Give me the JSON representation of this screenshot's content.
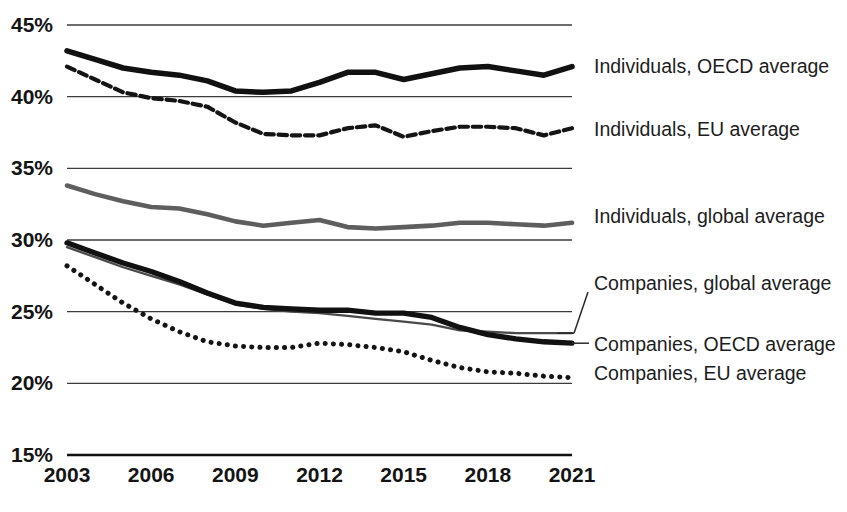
{
  "chart_data": {
    "type": "line",
    "title": "",
    "subtitle": "",
    "xlabel": "",
    "ylabel": "",
    "x": [
      2003,
      2004,
      2005,
      2006,
      2007,
      2008,
      2009,
      2010,
      2011,
      2012,
      2013,
      2014,
      2015,
      2016,
      2017,
      2018,
      2019,
      2020,
      2021
    ],
    "xlim": [
      2003,
      2021
    ],
    "ylim": [
      15,
      45
    ],
    "ytick_labels": [
      "45%",
      "40%",
      "35%",
      "30%",
      "25%",
      "20%",
      "15%"
    ],
    "ytick_values": [
      45,
      40,
      35,
      30,
      25,
      20,
      15
    ],
    "xtick_labels": [
      "2003",
      "2006",
      "2009",
      "2012",
      "2015",
      "2018",
      "2021"
    ],
    "xtick_values": [
      2003,
      2006,
      2009,
      2012,
      2015,
      2018,
      2021
    ],
    "grid": true,
    "grid_axis": "y",
    "legend_position": "right-inline-labels",
    "series": [
      {
        "name": "Individuals, OECD average",
        "style": "solid-bold",
        "color": "#111111",
        "width": 5.5,
        "label_y_pct": 42.5,
        "values": [
          43.2,
          42.6,
          42.0,
          41.7,
          41.5,
          41.1,
          40.4,
          40.3,
          40.4,
          41.0,
          41.7,
          41.7,
          41.2,
          41.6,
          42.0,
          42.1,
          41.8,
          41.5,
          42.1
        ]
      },
      {
        "name": "Individuals, EU average",
        "style": "dashed",
        "color": "#141414",
        "width": 4.2,
        "label_y_pct": 38.3,
        "values": [
          42.1,
          41.2,
          40.3,
          39.9,
          39.7,
          39.3,
          38.2,
          37.4,
          37.3,
          37.3,
          37.8,
          38.0,
          37.2,
          37.6,
          37.9,
          37.9,
          37.8,
          37.3,
          37.8
        ]
      },
      {
        "name": "Individuals, global average",
        "style": "solid-gray",
        "color": "#5e5e5e",
        "width": 4.6,
        "label_y_pct": 31.9,
        "values": [
          33.8,
          33.2,
          32.7,
          32.3,
          32.2,
          31.8,
          31.3,
          31.0,
          31.2,
          31.4,
          30.9,
          30.8,
          30.9,
          31.0,
          31.2,
          31.2,
          31.1,
          31.0,
          31.2
        ]
      },
      {
        "name": "Companies, global average",
        "style": "solid-thin",
        "color": "#4a4a4a",
        "width": 2.3,
        "label_y_pct": 27.3,
        "values": [
          29.5,
          28.8,
          28.1,
          27.5,
          26.9,
          26.2,
          25.5,
          25.2,
          25.0,
          24.9,
          24.7,
          24.5,
          24.3,
          24.1,
          23.7,
          23.6,
          23.5,
          23.5,
          23.5
        ]
      },
      {
        "name": "Companies, OECD average",
        "style": "solid-bold",
        "color": "#111111",
        "width": 5.3,
        "label_y_pct": 23.1,
        "values": [
          29.8,
          29.1,
          28.4,
          27.8,
          27.1,
          26.3,
          25.6,
          25.3,
          25.2,
          25.1,
          25.1,
          24.9,
          24.9,
          24.6,
          23.9,
          23.4,
          23.1,
          22.9,
          22.8
        ]
      },
      {
        "name": "Companies, EU average",
        "style": "dotted",
        "color": "#141414",
        "width": 5.0,
        "label_y_pct": 20.8,
        "values": [
          28.2,
          26.9,
          25.6,
          24.5,
          23.6,
          22.9,
          22.6,
          22.5,
          22.5,
          22.8,
          22.7,
          22.5,
          22.2,
          21.6,
          21.1,
          20.8,
          20.7,
          20.5,
          20.4
        ]
      }
    ]
  },
  "axes": {
    "y_labels": [
      "45%",
      "40%",
      "35%",
      "30%",
      "25%",
      "20%",
      "15%"
    ],
    "x_labels": [
      "2003",
      "2006",
      "2009",
      "2012",
      "2015",
      "2018",
      "2021"
    ]
  },
  "legend": {
    "items": [
      {
        "label": "Individuals, OECD average"
      },
      {
        "label": "Individuals, EU average"
      },
      {
        "label": "Individuals, global average"
      },
      {
        "label": "Companies, global average"
      },
      {
        "label": "Companies, OECD average"
      },
      {
        "label": "Companies, EU average"
      }
    ]
  },
  "colors": {
    "background": "#ffffff",
    "ink": "#111111",
    "gray_series": "#5e5e5e",
    "grid": "#3c3c3c"
  }
}
